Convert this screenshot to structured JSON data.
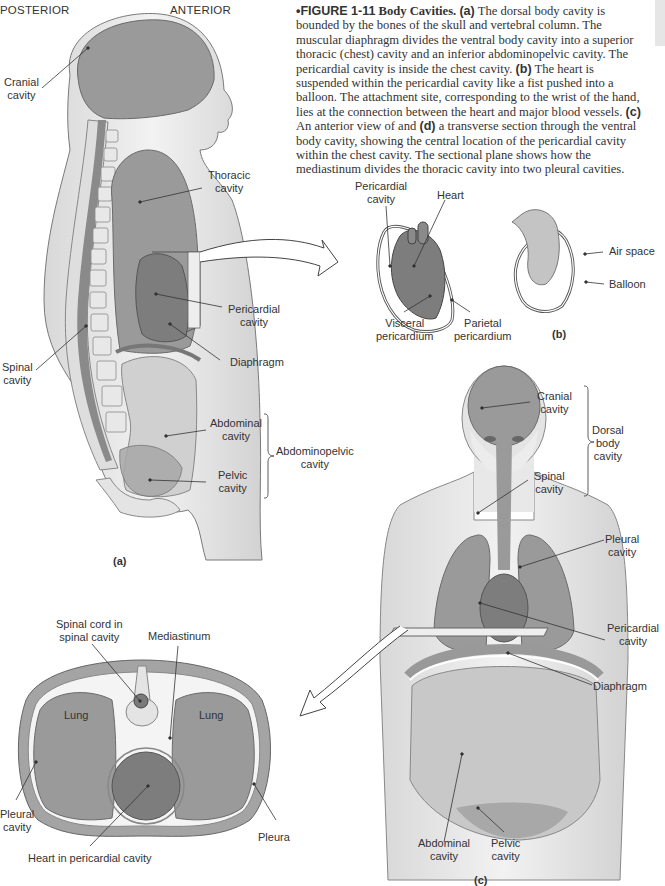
{
  "figure": {
    "number": "FIGURE 1-11",
    "bullet": "•",
    "title": "Body Cavities.",
    "caption_segments": [
      {
        "type": "part",
        "text": "(a)"
      },
      {
        "type": "text",
        "text": " The dorsal body cavity is bounded by the bones of the skull and vertebral column. The muscular diaphragm divides the ventral body cavity into a superior thoracic (chest) cavity and an inferior abdominopelvic cavity. The pericardial cavity is inside the chest cavity. "
      },
      {
        "type": "part",
        "text": "(b)"
      },
      {
        "type": "text",
        "text": " The heart is suspended within the pericardial cavity like a fist pushed into a balloon. The attachment site, corresponding to the wrist of the hand, lies at the connection between the heart and major blood vessels. "
      },
      {
        "type": "part",
        "text": "(c)"
      },
      {
        "type": "text",
        "text": " An anterior view of and "
      },
      {
        "type": "part",
        "text": "(d)"
      },
      {
        "type": "text",
        "text": " a transverse section through the ventral body cavity, showing the central location of the pericardial cavity within the chest cavity. The sectional plane shows how the mediastinum divides the thoracic cavity into two pleural cavities."
      }
    ]
  },
  "panel_a": {
    "part_label": "(a)",
    "orientation": {
      "posterior": "POSTERIOR",
      "anterior": "ANTERIOR"
    },
    "labels": {
      "cranial": "Cranial\ncavity",
      "thoracic": "Thoracic\ncavity",
      "pericardial": "Pericardial\ncavity",
      "spinal": "Spinal\ncavity",
      "diaphragm": "Diaphragm",
      "abdominal": "Abdominal\ncavity",
      "pelvic": "Pelvic\ncavity",
      "abdominopelvic": "Abdominopelvic\ncavity"
    }
  },
  "panel_b": {
    "part_label": "(b)",
    "labels": {
      "pericardial": "Pericardial\ncavity",
      "heart": "Heart",
      "visceral": "Visceral\npericardium",
      "parietal": "Parietal\npericardium",
      "air_space": "Air space",
      "balloon": "Balloon"
    }
  },
  "panel_c": {
    "part_label": "(c)",
    "labels": {
      "cranial": "Cranial\ncavity",
      "dorsal": "Dorsal\nbody\ncavity",
      "spinal": "Spinal\ncavity",
      "pleural": "Pleural\ncavity",
      "pericardial": "Pericardial\ncavity",
      "diaphragm": "Diaphragm",
      "abdominal": "Abdominal\ncavity",
      "pelvic": "Pelvic\ncavity"
    }
  },
  "panel_d": {
    "labels": {
      "spinal_cord": "Spinal cord in\nspinal cavity",
      "mediastinum": "Mediastinum",
      "lung_left": "Lung",
      "lung_right": "Lung",
      "pleural": "Pleural\ncavity",
      "pleura": "Pleura",
      "heart": "Heart in pericardial cavity"
    }
  },
  "colors": {
    "cavity_fill": "#9a9a9a",
    "pericardial_fill": "#7d7d7d",
    "lower_cavity_fill": "#c8c8c8",
    "skin": "#e6e6e6",
    "outline": "#6a6a6a",
    "leader": "#333333"
  }
}
